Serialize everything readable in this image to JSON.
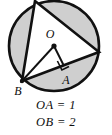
{
  "figure": {
    "colors": {
      "shaded_region": "#cfcfcf",
      "triangle_fill": "#ffffff",
      "stroke": "#111111",
      "background": "#ffffff"
    },
    "circle": {
      "center_label": "O",
      "center_x": 54,
      "center_y": 46,
      "radius": 46
    },
    "points": [
      {
        "label": "O",
        "role": "circle-center",
        "x": 54,
        "y": 46
      },
      {
        "label": "A",
        "role": "foot-of-perpendicular",
        "x": 64,
        "y": 66
      },
      {
        "label": "B",
        "role": "circle-point-lower-left",
        "x": 22,
        "y": 81
      }
    ],
    "inscribed_triangle": {
      "vertices": [
        {
          "x": 35,
          "y": 1
        },
        {
          "x": 99,
          "y": 52
        },
        {
          "x": 22,
          "y": 81
        }
      ]
    },
    "segments": [
      {
        "name": "OB",
        "from": "O",
        "to": "B"
      },
      {
        "name": "OA",
        "from": "O",
        "to": "A"
      },
      {
        "name": "BA",
        "from": "B",
        "to": "A"
      }
    ],
    "right_angle_mark": {
      "at": "A",
      "present": true
    },
    "captions": [
      "OA = 1",
      "OB = 2"
    ]
  }
}
